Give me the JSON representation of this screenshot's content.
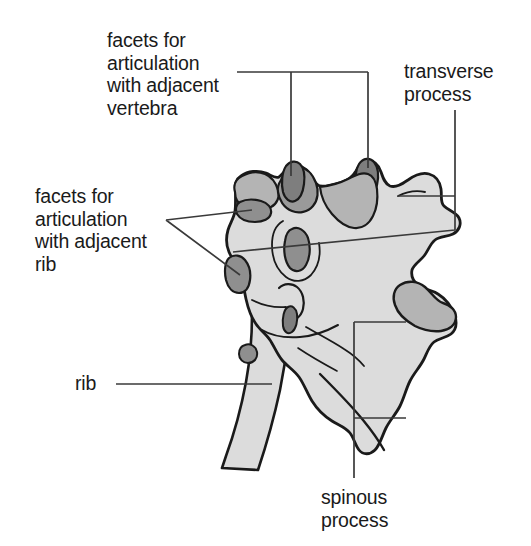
{
  "figure": {
    "view": "lateral oblique",
    "background_color": "#ffffff",
    "bone_fill_color": "#dcdcdc",
    "facet_fill_color": "#9a9a9a",
    "dark_facet_fill_color": "#8a8a8a",
    "outline_color": "#1a1a1a",
    "leader_line_color": "#3a3a3a",
    "text_color": "#1a1a1a"
  },
  "labels": {
    "facets_vertebra": {
      "text": "facets for\narticulation\nwith adjacent\nvertebra",
      "leader": "horizontal-bar-with-two-droppers",
      "points_to": "superior articular facets"
    },
    "facets_rib": {
      "text": "facets for\narticulation\nwith adjacent\nrib",
      "leader": "v-shaped-two-prong",
      "points_to": "costal facets"
    },
    "transverse_process": {
      "text": "transverse\nprocess",
      "leader": "vertical-with-branch",
      "points_to": "transverse process"
    },
    "rib": {
      "text": "rib",
      "leader": "horizontal",
      "points_to": "rib shaft"
    },
    "spinous_process": {
      "text": "spinous\nprocess",
      "leader": "bracket-two-branch",
      "points_to": "spinous process"
    }
  },
  "structures": [
    {
      "name": "superior-articular-facet-anterior",
      "shade": "dark"
    },
    {
      "name": "superior-articular-facet-posterior",
      "shade": "dark"
    },
    {
      "name": "superior-costal-facet",
      "shade": "mid"
    },
    {
      "name": "inferior-costal-facet",
      "shade": "mid"
    },
    {
      "name": "vertebral-foramen",
      "shade": "mid"
    },
    {
      "name": "transverse-process",
      "shade": "light"
    },
    {
      "name": "transverse-costal-facet",
      "shade": "mid"
    },
    {
      "name": "spinous-process",
      "shade": "light"
    },
    {
      "name": "rib-shaft",
      "shade": "light"
    },
    {
      "name": "vertebral-body",
      "shade": "light"
    }
  ]
}
